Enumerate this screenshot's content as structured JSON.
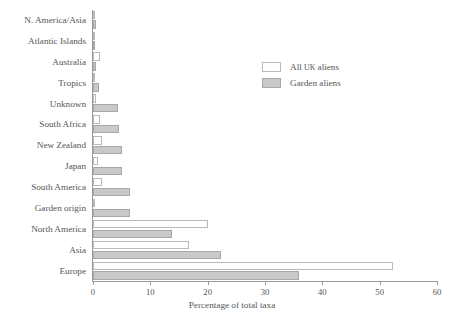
{
  "chart_data": {
    "type": "bar",
    "orientation": "horizontal",
    "title": "",
    "xlabel": "Percentage of total taxa",
    "ylabel": "",
    "xlim": [
      0,
      60
    ],
    "xticks": [
      0,
      10,
      20,
      30,
      40,
      50,
      60
    ],
    "grid": false,
    "legend_position": "upper right",
    "categories": [
      "N. America/Asia",
      "Atlantic Islands",
      "Australia",
      "Tropics",
      "Unknown",
      "South Africa",
      "New Zealand",
      "Japan",
      "South America",
      "Garden origin",
      "North America",
      "Asia",
      "Europe"
    ],
    "series": [
      {
        "name": "All UK aliens",
        "color": "#ffffff",
        "values": [
          0.2,
          0.3,
          1.3,
          0.3,
          0.5,
          1.3,
          1.5,
          0.8,
          1.5,
          0.1,
          20.0,
          16.8,
          52.4
        ]
      },
      {
        "name": "Garden aliens",
        "color": "#c9c9c9",
        "values": [
          0.5,
          0.4,
          0.5,
          1.0,
          4.3,
          4.5,
          5.0,
          5.0,
          6.5,
          6.5,
          13.8,
          22.4,
          36.0
        ]
      }
    ]
  },
  "legend": {
    "entries": [
      {
        "label_prefix": "All ",
        "label_smallcaps": "UK",
        "label_suffix": " aliens",
        "swatch": "white-swatch"
      },
      {
        "label_prefix": "Garden aliens",
        "label_smallcaps": "",
        "label_suffix": "",
        "swatch": "gray-swatch"
      }
    ]
  }
}
